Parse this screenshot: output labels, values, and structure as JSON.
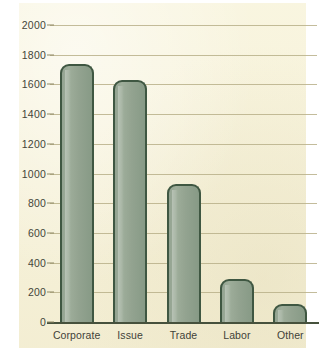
{
  "chart_data": {
    "type": "bar",
    "title": "",
    "xlabel": "",
    "ylabel": "",
    "categories": [
      "Corporate",
      "Issue",
      "Trade",
      "Labor",
      "Other"
    ],
    "values": [
      1740,
      1630,
      930,
      290,
      120
    ],
    "ylim": [
      0,
      2000
    ],
    "y_ticks": [
      0,
      200,
      400,
      600,
      800,
      1000,
      1200,
      1400,
      1600,
      1800,
      2000
    ],
    "y_tick_labels": [
      "0",
      "200",
      "400",
      "600",
      "800",
      "1000",
      "1200",
      "1400",
      "1600",
      "1800",
      "2000"
    ],
    "grid": true,
    "grid_axis": "y",
    "legend": false,
    "legend_position": "none",
    "series": [
      {
        "name": "",
        "values": [
          1740,
          1630,
          930,
          290,
          120
        ]
      }
    ]
  },
  "style": {
    "page_background": "#ffffff",
    "plot_background": "#f6f1d6",
    "bar_fill": "#93a391",
    "bar_outline": "#3f5742",
    "gridline_color": "#b9b089",
    "axis_color": "#46513c",
    "text_color": "#44453a"
  }
}
